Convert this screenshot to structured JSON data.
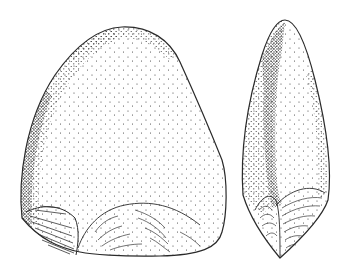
{
  "figure": {
    "views": [
      {
        "id": "face-view",
        "label": ""
      },
      {
        "id": "profile-view",
        "label": ""
      }
    ],
    "colors": {
      "background": "#ffffff",
      "ink": "#2a2a2a",
      "stipple": "#3a3a3a"
    }
  }
}
